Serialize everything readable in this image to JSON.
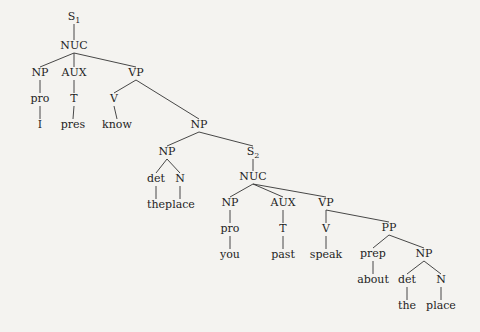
{
  "tree": {
    "nodes": [
      {
        "id": "s1",
        "label": "S",
        "sub": "1",
        "x": 74,
        "y": 20
      },
      {
        "id": "nuc1",
        "label": "NUC",
        "x": 74,
        "y": 49
      },
      {
        "id": "np1",
        "label": "NP",
        "x": 40,
        "y": 76
      },
      {
        "id": "aux1",
        "label": "AUX",
        "x": 74,
        "y": 76
      },
      {
        "id": "vp1",
        "label": "VP",
        "x": 136,
        "y": 76
      },
      {
        "id": "pro1",
        "label": "pro",
        "x": 40,
        "y": 102
      },
      {
        "id": "t1",
        "label": "T",
        "x": 74,
        "y": 102
      },
      {
        "id": "v1",
        "label": "V",
        "x": 114,
        "y": 102
      },
      {
        "id": "w_i",
        "label": "I",
        "x": 40,
        "y": 128
      },
      {
        "id": "w_pres",
        "label": "pres",
        "x": 73,
        "y": 128
      },
      {
        "id": "w_know",
        "label": "know",
        "x": 117,
        "y": 128
      },
      {
        "id": "np2",
        "label": "NP",
        "x": 199,
        "y": 128
      },
      {
        "id": "np3",
        "label": "NP",
        "x": 167,
        "y": 155
      },
      {
        "id": "s2",
        "label": "S",
        "sub": "2",
        "x": 253,
        "y": 155
      },
      {
        "id": "det1",
        "label": "det",
        "x": 156,
        "y": 182
      },
      {
        "id": "n1",
        "label": "N",
        "x": 180,
        "y": 182
      },
      {
        "id": "nuc2",
        "label": "NUC",
        "x": 253,
        "y": 180
      },
      {
        "id": "w_the1",
        "label": "the",
        "x": 156,
        "y": 208
      },
      {
        "id": "w_place1",
        "label": "place",
        "x": 180,
        "y": 208
      },
      {
        "id": "np4",
        "label": "NP",
        "x": 230,
        "y": 206
      },
      {
        "id": "aux2",
        "label": "AUX",
        "x": 283,
        "y": 206
      },
      {
        "id": "vp2",
        "label": "VP",
        "x": 326,
        "y": 206
      },
      {
        "id": "pro2",
        "label": "pro",
        "x": 230,
        "y": 232
      },
      {
        "id": "t2",
        "label": "T",
        "x": 283,
        "y": 232
      },
      {
        "id": "v2",
        "label": "V",
        "x": 326,
        "y": 232
      },
      {
        "id": "pp",
        "label": "PP",
        "x": 389,
        "y": 231
      },
      {
        "id": "w_you",
        "label": "you",
        "x": 230,
        "y": 258
      },
      {
        "id": "w_past",
        "label": "past",
        "x": 283,
        "y": 258
      },
      {
        "id": "w_speak",
        "label": "speak",
        "x": 326,
        "y": 258
      },
      {
        "id": "prep",
        "label": "prep",
        "x": 373,
        "y": 257
      },
      {
        "id": "np5",
        "label": "NP",
        "x": 424,
        "y": 257
      },
      {
        "id": "w_about",
        "label": "about",
        "x": 373,
        "y": 283
      },
      {
        "id": "det2",
        "label": "det",
        "x": 407,
        "y": 283
      },
      {
        "id": "n2",
        "label": "N",
        "x": 441,
        "y": 283
      },
      {
        "id": "w_the2",
        "label": "the",
        "x": 407,
        "y": 309
      },
      {
        "id": "w_place2",
        "label": "place",
        "x": 441,
        "y": 309
      }
    ],
    "edges": [
      [
        "s1",
        "nuc1"
      ],
      [
        "nuc1",
        "np1"
      ],
      [
        "nuc1",
        "aux1"
      ],
      [
        "nuc1",
        "vp1"
      ],
      [
        "np1",
        "pro1"
      ],
      [
        "aux1",
        "t1"
      ],
      [
        "vp1",
        "v1"
      ],
      [
        "vp1",
        "np2"
      ],
      [
        "pro1",
        "w_i"
      ],
      [
        "t1",
        "w_pres"
      ],
      [
        "v1",
        "w_know"
      ],
      [
        "np2",
        "np3"
      ],
      [
        "np2",
        "s2"
      ],
      [
        "np3",
        "det1"
      ],
      [
        "np3",
        "n1"
      ],
      [
        "det1",
        "w_the1"
      ],
      [
        "n1",
        "w_place1"
      ],
      [
        "s2",
        "nuc2"
      ],
      [
        "nuc2",
        "np4"
      ],
      [
        "nuc2",
        "aux2"
      ],
      [
        "nuc2",
        "vp2"
      ],
      [
        "np4",
        "pro2"
      ],
      [
        "aux2",
        "t2"
      ],
      [
        "vp2",
        "v2"
      ],
      [
        "vp2",
        "pp"
      ],
      [
        "pro2",
        "w_you"
      ],
      [
        "t2",
        "w_past"
      ],
      [
        "v2",
        "w_speak"
      ],
      [
        "pp",
        "prep"
      ],
      [
        "pp",
        "np5"
      ],
      [
        "prep",
        "w_about"
      ],
      [
        "np5",
        "det2"
      ],
      [
        "np5",
        "n2"
      ],
      [
        "det2",
        "w_the2"
      ],
      [
        "n2",
        "w_place2"
      ]
    ]
  }
}
